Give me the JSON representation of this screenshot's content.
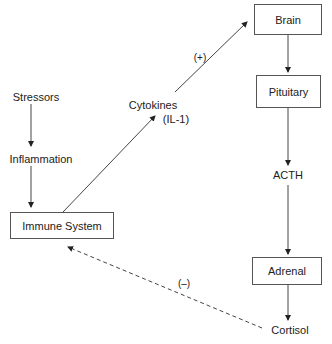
{
  "diagram": {
    "nodes": {
      "brain": "Brain",
      "pituitary": "Pituitary",
      "acth": "ACTH",
      "adrenal": "Adrenal",
      "cortisol": "Cortisol",
      "immune": "Immune System",
      "stressors": "Stressors",
      "inflammation": "Inflammation",
      "cytokines_line1": "Cytokines",
      "cytokines_line2": "(IL-1)"
    },
    "edge_labels": {
      "positive": "(+)",
      "negative": "(–)"
    },
    "edges": [
      {
        "from": "Stressors",
        "to": "Inflammation",
        "style": "solid"
      },
      {
        "from": "Inflammation",
        "to": "Immune System",
        "style": "solid"
      },
      {
        "from": "Immune System",
        "to": "Cytokines (IL-1)",
        "style": "solid"
      },
      {
        "from": "Cytokines (IL-1)",
        "to": "Brain",
        "style": "solid",
        "label": "(+)"
      },
      {
        "from": "Brain",
        "to": "Pituitary",
        "style": "solid"
      },
      {
        "from": "Pituitary",
        "to": "ACTH",
        "style": "solid"
      },
      {
        "from": "ACTH",
        "to": "Adrenal",
        "style": "solid"
      },
      {
        "from": "Adrenal",
        "to": "Cortisol",
        "style": "solid"
      },
      {
        "from": "Cortisol",
        "to": "Immune System",
        "style": "dashed",
        "label": "(–)"
      }
    ],
    "colors": {
      "line": "#333333",
      "box_border": "#555555",
      "background": "#ffffff"
    }
  }
}
